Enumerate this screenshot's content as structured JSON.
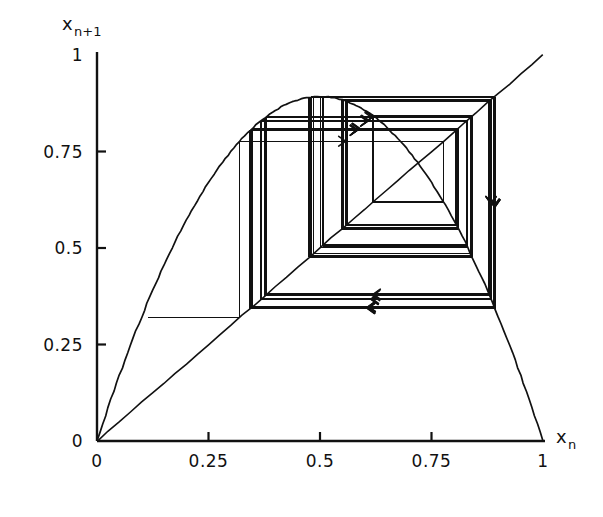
{
  "figure": {
    "kind": "cobweb-diagram",
    "background": "#ffffff",
    "ink": "#111111"
  },
  "axes": {
    "x": {
      "name": "x",
      "subscript": "n",
      "ticks": [
        "0",
        "0.25",
        "0.5",
        "0.75",
        "1"
      ],
      "tick_values": [
        0,
        0.25,
        0.5,
        0.75,
        1
      ],
      "range": [
        0,
        1
      ]
    },
    "y": {
      "name": "x",
      "subscript": "n+1",
      "ticks": [
        "0",
        "0.25",
        "0.5",
        "0.75",
        "1"
      ],
      "tick_values": [
        0,
        0.25,
        0.5,
        0.75,
        1
      ],
      "range": [
        0,
        1
      ]
    }
  },
  "chart_data": {
    "type": "line",
    "title": "",
    "xlabel": "x_n",
    "ylabel": "x_n+1",
    "xlim": [
      0,
      1
    ],
    "ylim": [
      0,
      1
    ],
    "grid": false,
    "legend": "none",
    "series": [
      {
        "name": "map-curve",
        "kind": "parabola",
        "equation": "f(x) = r*x*(1-x)",
        "r": 3.57,
        "peak": [
          0.5,
          0.8925
        ],
        "x": [
          0,
          0.05,
          0.1,
          0.15,
          0.2,
          0.25,
          0.3,
          0.35,
          0.4,
          0.45,
          0.5,
          0.55,
          0.6,
          0.65,
          0.7,
          0.75,
          0.8,
          0.85,
          0.9,
          0.95,
          1
        ],
        "y": [
          0,
          0.1696,
          0.3213,
          0.4551,
          0.5712,
          0.6694,
          0.7497,
          0.8122,
          0.8568,
          0.8836,
          0.8925,
          0.8836,
          0.8568,
          0.8122,
          0.7497,
          0.6694,
          0.5712,
          0.4551,
          0.3213,
          0.1696,
          0
        ]
      },
      {
        "name": "identity-line",
        "kind": "diagonal",
        "equation": "y = x",
        "x": [
          0,
          1
        ],
        "y": [
          0,
          1
        ]
      },
      {
        "name": "cobweb-orbit",
        "kind": "cobweb",
        "x0": 0.115,
        "start_point": [
          0.115,
          0.32
        ],
        "orbit": [
          0.32,
          0.7767,
          0.6192,
          0.8416,
          0.4755,
          0.8903,
          0.3485,
          0.8103,
          0.5483,
          0.8838,
          0.3663,
          0.8283,
          0.5076,
          0.8923,
          0.343,
          0.8044,
          0.5613,
          0.8787,
          0.3804,
          0.8411,
          0.4769,
          0.8905,
          0.348,
          0.8097,
          0.5496,
          0.8835,
          0.3673,
          0.8292,
          0.5056,
          0.8922,
          0.3434,
          0.8049,
          0.5602,
          0.8792,
          0.379,
          0.8399,
          0.4799,
          0.8908,
          0.3471,
          0.8087,
          0.5519,
          0.8829,
          0.3691,
          0.831,
          0.5016,
          0.8921,
          0.3442,
          0.8061,
          0.558,
          0.8801,
          0.3765,
          0.8377,
          0.4852,
          0.8912
        ]
      }
    ]
  },
  "annotations": {
    "arrow_count_visible": 34,
    "arrow_style": "open-chevron"
  }
}
